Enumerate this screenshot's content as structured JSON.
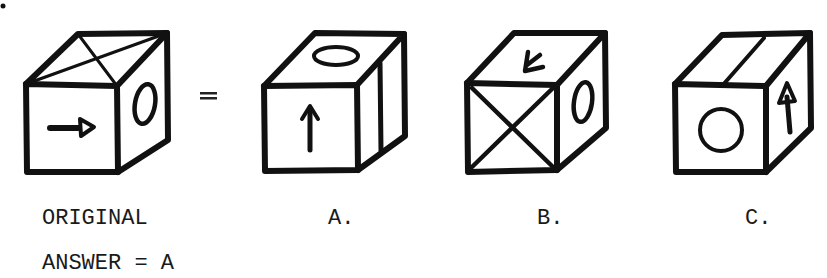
{
  "puzzle": {
    "type": "cube-folding / spatial reasoning",
    "equals_sign": "=",
    "original": {
      "label": "ORIGINAL",
      "faces": {
        "front": "arrow pointing right",
        "top": "X (two diagonals)",
        "right": "vertical oval"
      }
    },
    "options": [
      {
        "label": "A.",
        "faces": {
          "front": "arrow pointing up",
          "top": "horizontal oval",
          "right": "single vertical line"
        }
      },
      {
        "label": "B.",
        "faces": {
          "front": "X (two diagonals)",
          "top": "arrow pointing down-left",
          "right": "vertical oval"
        }
      },
      {
        "label": "C.",
        "faces": {
          "front": "circle",
          "top": "single diagonal line",
          "right": "arrow pointing up"
        }
      }
    ],
    "answer_text": "ANSWER = A",
    "answer": "A"
  }
}
